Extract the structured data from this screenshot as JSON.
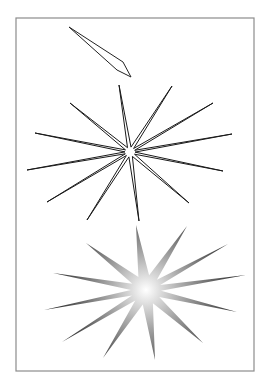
{
  "canvas": {
    "width": 267,
    "height": 384,
    "background": "#ffffff"
  },
  "frame": {
    "x1": 16,
    "y1": 18,
    "x2": 254,
    "y2": 371,
    "stroke": "#8c8c8c"
  },
  "quill": {
    "points": [
      [
        69,
        27
      ],
      [
        123,
        62
      ],
      [
        131,
        77
      ],
      [
        117,
        70
      ]
    ],
    "stroke": "#222222"
  },
  "outline_star": {
    "center": [
      130,
      152
    ],
    "tips": [
      [
        119,
        85
      ],
      [
        172,
        86
      ],
      [
        213,
        103
      ],
      [
        232,
        134
      ],
      [
        223,
        171
      ],
      [
        189,
        203
      ],
      [
        139,
        221
      ],
      [
        87,
        220
      ],
      [
        47,
        202
      ],
      [
        27,
        170
      ],
      [
        35,
        133
      ],
      [
        70,
        103
      ]
    ],
    "inner_radius": 5,
    "stroke": "#1a1a1a"
  },
  "filled_star": {
    "center": [
      146,
      290
    ],
    "tips": [
      [
        136,
        225
      ],
      [
        187,
        226
      ],
      [
        228,
        244
      ],
      [
        246,
        275
      ],
      [
        237,
        312
      ],
      [
        203,
        343
      ],
      [
        155,
        360
      ],
      [
        103,
        358
      ],
      [
        62,
        342
      ],
      [
        44,
        310
      ],
      [
        53,
        273
      ],
      [
        86,
        243
      ]
    ],
    "inner_radius": 15,
    "gradient": {
      "center": "#ffffff",
      "mid": "#a8a8a8",
      "edge": "#111111"
    }
  }
}
